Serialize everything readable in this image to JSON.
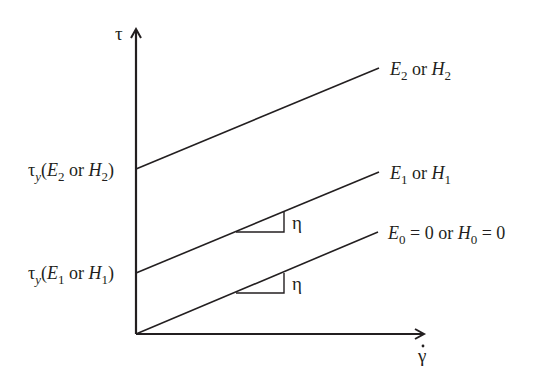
{
  "diagram": {
    "type": "bingham_flow_curves",
    "axes": {
      "y_label": "τ",
      "x_label": "γ̇",
      "x_label_base": "γ",
      "x_label_dot": "·"
    },
    "lines": [
      {
        "id": "E2",
        "end_label": {
          "E": "E",
          "E_sub": "2",
          "or": " or ",
          "H": "H",
          "H_sub": "2"
        },
        "intercept_label": {
          "tau": "τ",
          "tau_sub": "y",
          "open": "(",
          "E": "E",
          "E_sub": "2",
          "or": " or ",
          "H": "H",
          "H_sub": "2",
          "close": ")"
        }
      },
      {
        "id": "E1",
        "end_label": {
          "E": "E",
          "E_sub": "1",
          "or": " or ",
          "H": "H",
          "H_sub": "1"
        },
        "intercept_label": {
          "tau": "τ",
          "tau_sub": "y",
          "open": "(",
          "E": "E",
          "E_sub": "1",
          "or": " or ",
          "H": "H",
          "H_sub": "1",
          "close": ")"
        }
      },
      {
        "id": "E0",
        "end_label": {
          "E": "E",
          "E_sub": "0",
          "eq1": " = 0 or ",
          "H": "H",
          "H_sub": "0",
          "eq2": " = 0"
        }
      }
    ],
    "slope_label": "η"
  }
}
